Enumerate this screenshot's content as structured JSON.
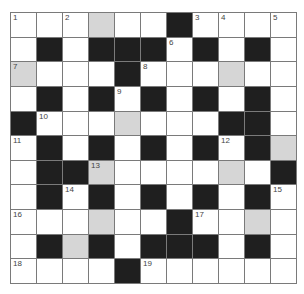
{
  "puzzle": {
    "type": "crossword",
    "rows": 11,
    "cols": 11,
    "legend": {
      "W": "white",
      "B": "black",
      "G": "shaded"
    },
    "colors": {
      "white": "#ffffff",
      "black": "#1f1f1f",
      "shaded": "#d6d6d6",
      "gridline": "#7a7a7a",
      "number": "#444444"
    },
    "grid": [
      [
        "W",
        "W",
        "W",
        "G",
        "W",
        "W",
        "B",
        "W",
        "W",
        "W",
        "W"
      ],
      [
        "W",
        "B",
        "W",
        "B",
        "B",
        "B",
        "W",
        "B",
        "W",
        "B",
        "W"
      ],
      [
        "G",
        "W",
        "W",
        "W",
        "B",
        "W",
        "W",
        "W",
        "G",
        "W",
        "W"
      ],
      [
        "W",
        "B",
        "W",
        "B",
        "W",
        "B",
        "W",
        "B",
        "W",
        "B",
        "W"
      ],
      [
        "B",
        "W",
        "W",
        "W",
        "G",
        "W",
        "W",
        "W",
        "B",
        "B",
        "W"
      ],
      [
        "W",
        "B",
        "W",
        "B",
        "W",
        "B",
        "W",
        "B",
        "W",
        "B",
        "G"
      ],
      [
        "W",
        "B",
        "B",
        "G",
        "W",
        "W",
        "W",
        "W",
        "G",
        "W",
        "B"
      ],
      [
        "W",
        "B",
        "W",
        "B",
        "W",
        "B",
        "W",
        "B",
        "W",
        "B",
        "W"
      ],
      [
        "W",
        "W",
        "W",
        "G",
        "W",
        "W",
        "B",
        "W",
        "W",
        "G",
        "W"
      ],
      [
        "W",
        "B",
        "G",
        "B",
        "W",
        "B",
        "B",
        "B",
        "W",
        "B",
        "W"
      ],
      [
        "W",
        "W",
        "W",
        "W",
        "B",
        "W",
        "W",
        "W",
        "W",
        "W",
        "W"
      ]
    ],
    "numbers": [
      {
        "n": "1",
        "r": 0,
        "c": 0
      },
      {
        "n": "2",
        "r": 0,
        "c": 2
      },
      {
        "n": "3",
        "r": 0,
        "c": 7
      },
      {
        "n": "4",
        "r": 0,
        "c": 8
      },
      {
        "n": "5",
        "r": 0,
        "c": 10
      },
      {
        "n": "6",
        "r": 1,
        "c": 6
      },
      {
        "n": "7",
        "r": 2,
        "c": 0
      },
      {
        "n": "8",
        "r": 2,
        "c": 5
      },
      {
        "n": "9",
        "r": 3,
        "c": 4
      },
      {
        "n": "10",
        "r": 4,
        "c": 1
      },
      {
        "n": "11",
        "r": 5,
        "c": 0
      },
      {
        "n": "12",
        "r": 5,
        "c": 8
      },
      {
        "n": "13",
        "r": 6,
        "c": 3
      },
      {
        "n": "14",
        "r": 7,
        "c": 2
      },
      {
        "n": "15",
        "r": 7,
        "c": 10
      },
      {
        "n": "16",
        "r": 8,
        "c": 0
      },
      {
        "n": "17",
        "r": 8,
        "c": 7
      },
      {
        "n": "18",
        "r": 10,
        "c": 0
      },
      {
        "n": "19",
        "r": 10,
        "c": 5
      }
    ]
  }
}
